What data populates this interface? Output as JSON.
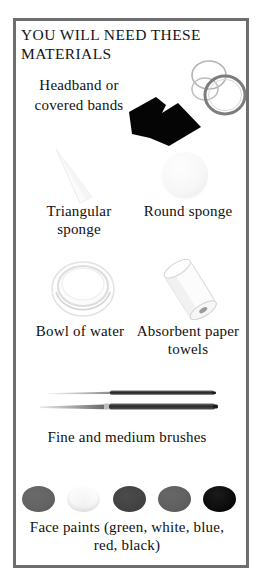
{
  "page": {
    "title": "YOU WILL NEED THESE MATERIALS",
    "frame_color": "#6e6e70",
    "background": "#ffffff",
    "text_color": "#111013"
  },
  "items": [
    {
      "id": "headband",
      "label": "Headband or covered bands",
      "icon": "headband-and-hair-bands-illustration",
      "color": "#000000"
    },
    {
      "id": "triangular-sponge",
      "label": "Triangular sponge",
      "icon": "triangular-sponge-illustration",
      "color": "#f4f4f4"
    },
    {
      "id": "round-sponge",
      "label": "Round sponge",
      "icon": "round-sponge-illustration",
      "color": "#f7f7f7"
    },
    {
      "id": "bowl-of-water",
      "label": "Bowl of water",
      "icon": "bowl-of-water-illustration",
      "color": "#fafafa"
    },
    {
      "id": "absorbent-paper-towels",
      "label": "Absorbent paper towels",
      "icon": "paper-towel-roll-illustration",
      "color": "#ffffff"
    },
    {
      "id": "brushes",
      "label": "Fine and medium brushes",
      "icon": "paint-brushes-illustration",
      "color": "#2b2b2b"
    },
    {
      "id": "face-paints",
      "label": "Face paints (green, white, blue, red, black)",
      "icon": "face-paint-dots-illustration",
      "color": "#4b4b4b"
    }
  ],
  "labels": {
    "headband": "Headband or covered bands",
    "triangular_sponge": "Triangular sponge",
    "round_sponge": "Round sponge",
    "bowl_of_water": "Bowl of water",
    "paper_towels": "Absorbent paper towels",
    "brushes": "Fine and medium brushes",
    "face_paints": "Face paints (green, white, blue, red, black)"
  },
  "paint_dots": [
    {
      "name": "green",
      "swatch": "#636363"
    },
    {
      "name": "white",
      "swatch": "#ffffff"
    },
    {
      "name": "blue",
      "swatch": "#434343"
    },
    {
      "name": "red",
      "swatch": "#606060"
    },
    {
      "name": "black",
      "swatch": "#0c0c0c"
    }
  ]
}
